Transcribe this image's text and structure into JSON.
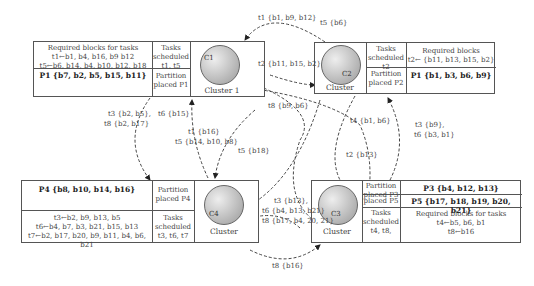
{
  "clusters": [
    {
      "id": "C1",
      "icon_label": "C1",
      "name": "Cluster 1",
      "required_title": "Required blocks for tasks",
      "required_lines": [
        "t1←b1, b4, b16, b9 b12",
        "t5←b6, b14, b4, b10, b12, b18"
      ],
      "tasks_title": "Tasks",
      "tasks_sub": "scheduled",
      "tasks_list": "t1, t5",
      "partition_label": "Partition",
      "partition_placed": "placed P1",
      "partition_blocks": "P1 {b7, b2, b5, b15, b11}"
    },
    {
      "id": "C2",
      "icon_label": "C2",
      "name": "Cluster",
      "required_title": "Required blocks",
      "required_lines": [
        "t2← {b11, b13, b15, b2}"
      ],
      "tasks_title": "Tasks",
      "tasks_sub": "scheduled",
      "tasks_list": "t2",
      "partition_label": "Partition",
      "partition_placed": "placed P2",
      "partition_blocks": "P1 {b1, b3, b6, b9}"
    },
    {
      "id": "C4",
      "icon_label": "C4",
      "name": "Cluster",
      "required_lines": [
        "t3←b2, b9, b13, b5",
        "t6←b4, b7, b3, b21, b15, b13",
        "t7←b2, b17, b20, b9, b11, b4, b6, b21"
      ],
      "tasks_title": "Tasks",
      "tasks_sub": "scheduled",
      "tasks_list": "t3, t6, t7",
      "partition_label": "Partition",
      "partition_placed": "placed P4",
      "partition_blocks": "P4 {b8, b10, b14, b16}"
    },
    {
      "id": "C3",
      "icon_label": "C3",
      "name": "Cluster",
      "required_title": "Required blocks for tasks",
      "required_lines": [
        "t4←b5, b6, b1",
        "t8←b16"
      ],
      "tasks_title": "Tasks",
      "tasks_sub": "scheduled",
      "tasks_list": "t4, t8,",
      "partition_label": "Partition",
      "partition_placed_p3": "placed P3",
      "partition_placed_p5": "placed P5",
      "partition_blocks_p3": "P3 {b4, b12, b13}",
      "partition_blocks_p5": "P5 {b17, b18, b19, b20, b21}"
    }
  ],
  "transfers": [
    {
      "label": "t1 {b1, b9, b12}"
    },
    {
      "label": "t5 {b6}"
    },
    {
      "label": "t2 {b11, b15, b2}"
    },
    {
      "label": "t8 {b9, b6}"
    },
    {
      "label": "t3 {b2, b5},"
    },
    {
      "label": "t8 {b2, b17}"
    },
    {
      "label": "t6 {b15}"
    },
    {
      "label": "t1 {b16}"
    },
    {
      "label": "t5 {b14, b10, b8}"
    },
    {
      "label": "t5 {b18}"
    },
    {
      "label": "t4 {b1, b6}"
    },
    {
      "label": "t2 {b13}"
    },
    {
      "label": "t3 {b9},"
    },
    {
      "label": "t6 {b3, b1}"
    },
    {
      "label": "t3 {b13},"
    },
    {
      "label": "t6 {b4, b13, b21}"
    },
    {
      "label": "t8 {b17, b4, 20, 21}"
    },
    {
      "label": "t8 {b16}"
    }
  ]
}
